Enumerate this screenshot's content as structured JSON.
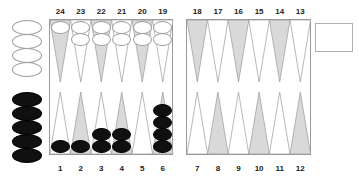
{
  "board": {
    "title": "backgammon-board",
    "colors": {
      "background": "#ffffff",
      "point_shaded": "#d9d9d9",
      "point_plain": "#ffffff",
      "point_outline": "#9a9a9a",
      "frame": "#9a9a9a",
      "checker_white_fill": "#ffffff",
      "checker_white_border": "#9d9d9d",
      "checker_black_fill": "#101010",
      "checker_black_border": "#000000",
      "label_text": "#1a1a1a"
    },
    "top_point_labels": [
      "24",
      "23",
      "22",
      "21",
      "20",
      "19",
      "18",
      "17",
      "16",
      "15",
      "14",
      "13"
    ],
    "bottom_point_labels": [
      "1",
      "2",
      "3",
      "4",
      "5",
      "6",
      "7",
      "8",
      "9",
      "10",
      "11",
      "12"
    ],
    "points": [
      {
        "label": "24",
        "row": "top",
        "quadrant": "top-left",
        "index": 0,
        "shaded": true,
        "checkers": 1,
        "color": "white"
      },
      {
        "label": "23",
        "row": "top",
        "quadrant": "top-left",
        "index": 1,
        "shaded": false,
        "checkers": 2,
        "color": "white"
      },
      {
        "label": "22",
        "row": "top",
        "quadrant": "top-left",
        "index": 2,
        "shaded": true,
        "checkers": 2,
        "color": "white"
      },
      {
        "label": "21",
        "row": "top",
        "quadrant": "top-left",
        "index": 3,
        "shaded": false,
        "checkers": 2,
        "color": "white"
      },
      {
        "label": "20",
        "row": "top",
        "quadrant": "top-left",
        "index": 4,
        "shaded": true,
        "checkers": 2,
        "color": "white"
      },
      {
        "label": "19",
        "row": "top",
        "quadrant": "top-left",
        "index": 5,
        "shaded": false,
        "checkers": 2,
        "color": "white"
      },
      {
        "label": "18",
        "row": "top",
        "quadrant": "top-right",
        "index": 0,
        "shaded": true,
        "checkers": 0,
        "color": "none"
      },
      {
        "label": "17",
        "row": "top",
        "quadrant": "top-right",
        "index": 1,
        "shaded": false,
        "checkers": 0,
        "color": "none"
      },
      {
        "label": "16",
        "row": "top",
        "quadrant": "top-right",
        "index": 2,
        "shaded": true,
        "checkers": 0,
        "color": "none"
      },
      {
        "label": "15",
        "row": "top",
        "quadrant": "top-right",
        "index": 3,
        "shaded": false,
        "checkers": 0,
        "color": "none"
      },
      {
        "label": "14",
        "row": "top",
        "quadrant": "top-right",
        "index": 4,
        "shaded": true,
        "checkers": 0,
        "color": "none"
      },
      {
        "label": "13",
        "row": "top",
        "quadrant": "top-right",
        "index": 5,
        "shaded": false,
        "checkers": 0,
        "color": "none"
      },
      {
        "label": "1",
        "row": "bottom",
        "quadrant": "bottom-left",
        "index": 0,
        "shaded": false,
        "checkers": 1,
        "color": "black"
      },
      {
        "label": "2",
        "row": "bottom",
        "quadrant": "bottom-left",
        "index": 1,
        "shaded": true,
        "checkers": 1,
        "color": "black"
      },
      {
        "label": "3",
        "row": "bottom",
        "quadrant": "bottom-left",
        "index": 2,
        "shaded": false,
        "checkers": 2,
        "color": "black"
      },
      {
        "label": "4",
        "row": "bottom",
        "quadrant": "bottom-left",
        "index": 3,
        "shaded": true,
        "checkers": 2,
        "color": "black"
      },
      {
        "label": "5",
        "row": "bottom",
        "quadrant": "bottom-left",
        "index": 4,
        "shaded": false,
        "checkers": 0,
        "color": "none"
      },
      {
        "label": "6",
        "row": "bottom",
        "quadrant": "bottom-left",
        "index": 5,
        "shaded": true,
        "checkers": 4,
        "color": "black"
      },
      {
        "label": "7",
        "row": "bottom",
        "quadrant": "bottom-right",
        "index": 0,
        "shaded": false,
        "checkers": 0,
        "color": "none"
      },
      {
        "label": "8",
        "row": "bottom",
        "quadrant": "bottom-right",
        "index": 1,
        "shaded": true,
        "checkers": 0,
        "color": "none"
      },
      {
        "label": "9",
        "row": "bottom",
        "quadrant": "bottom-right",
        "index": 2,
        "shaded": false,
        "checkers": 0,
        "color": "none"
      },
      {
        "label": "10",
        "row": "bottom",
        "quadrant": "bottom-right",
        "index": 3,
        "shaded": true,
        "checkers": 0,
        "color": "none"
      },
      {
        "label": "11",
        "row": "bottom",
        "quadrant": "bottom-right",
        "index": 4,
        "shaded": false,
        "checkers": 0,
        "color": "none"
      },
      {
        "label": "12",
        "row": "bottom",
        "quadrant": "bottom-right",
        "index": 5,
        "shaded": true,
        "checkers": 0,
        "color": "none"
      }
    ],
    "off_trays": {
      "white_borne_off": {
        "count": 4,
        "color": "white",
        "position": "left-top"
      },
      "black_borne_off": {
        "count": 5,
        "color": "black",
        "position": "left-bottom"
      },
      "empty_box": {
        "label": "",
        "position": "right-top"
      }
    }
  }
}
